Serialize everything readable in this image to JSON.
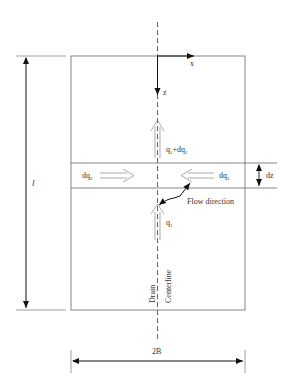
{
  "diagram": {
    "type": "drain flow schematic",
    "labels": {
      "axis_x": "x",
      "axis_z": "z",
      "flow_top": "q",
      "flow_top_sub": "1",
      "flow_top_plus": "+dq",
      "flow_top_plus_sub": "1",
      "lateral_left": "dq",
      "lateral_left_sub": "2",
      "lateral_right": "dq",
      "lateral_right_sub": "2",
      "band_height": "dz",
      "flow_direction": "Flow direction",
      "flow_bottom": "q",
      "flow_bottom_sub": "1",
      "length": "l",
      "width": "2B",
      "drain": "Drain",
      "centerline": "Centerline"
    },
    "colors": {
      "line": "#555555",
      "arrow": "#111111",
      "text": "#333333"
    }
  }
}
